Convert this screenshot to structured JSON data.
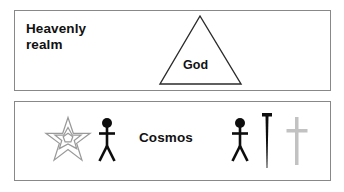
{
  "canvas": {
    "width": 344,
    "height": 192,
    "background": "#ffffff"
  },
  "colors": {
    "text": "#111111",
    "box_border": "#888888",
    "triangle_stroke": "#2b2b2b",
    "star_stroke": "#9a9a9a",
    "figure_fill": "#0d0d0d",
    "nail_fill": "#0d0d0d",
    "cross_fill": "#c2c2c2"
  },
  "realms": [
    {
      "id": "heavenly",
      "label": "Heavenly\nrealm",
      "symbols": [
        {
          "name": "triangle",
          "label": "God"
        }
      ]
    },
    {
      "id": "cosmos",
      "label": "Cosmos",
      "symbols": [
        {
          "name": "seven-pointed-star",
          "label": ""
        },
        {
          "name": "stick-figure-left",
          "label": ""
        },
        {
          "name": "stick-figure-right",
          "label": ""
        },
        {
          "name": "nail",
          "label": ""
        },
        {
          "name": "cross",
          "label": ""
        }
      ]
    }
  ],
  "labels": {
    "heavenly_realm": "Heavenly\nrealm",
    "god": "God",
    "cosmos": "Cosmos"
  }
}
